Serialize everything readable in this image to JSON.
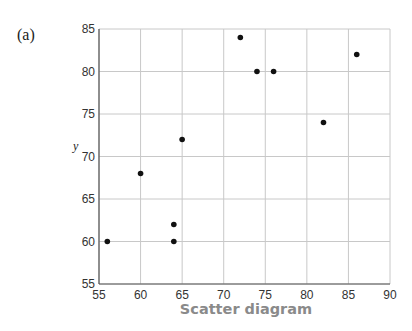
{
  "panel_label": "(a)",
  "chart_data": {
    "type": "scatter",
    "title": "Scatter diagram",
    "xlabel": "",
    "ylabel": "y",
    "xlim": [
      55,
      90
    ],
    "ylim": [
      55,
      85
    ],
    "xticks": [
      55,
      60,
      65,
      70,
      75,
      80,
      85,
      90
    ],
    "yticks": [
      55,
      60,
      65,
      70,
      75,
      80,
      85
    ],
    "grid": true,
    "legend": null,
    "points": [
      {
        "x": 56,
        "y": 60
      },
      {
        "x": 60,
        "y": 68
      },
      {
        "x": 64,
        "y": 62
      },
      {
        "x": 64,
        "y": 60
      },
      {
        "x": 65,
        "y": 72
      },
      {
        "x": 72,
        "y": 84
      },
      {
        "x": 74,
        "y": 80
      },
      {
        "x": 76,
        "y": 80
      },
      {
        "x": 82,
        "y": 74
      },
      {
        "x": 86,
        "y": 82
      }
    ],
    "colors": {
      "points": "#111111",
      "grid": "#c8c8c8",
      "axis": "#555555",
      "title": "#8a8a8a"
    }
  }
}
